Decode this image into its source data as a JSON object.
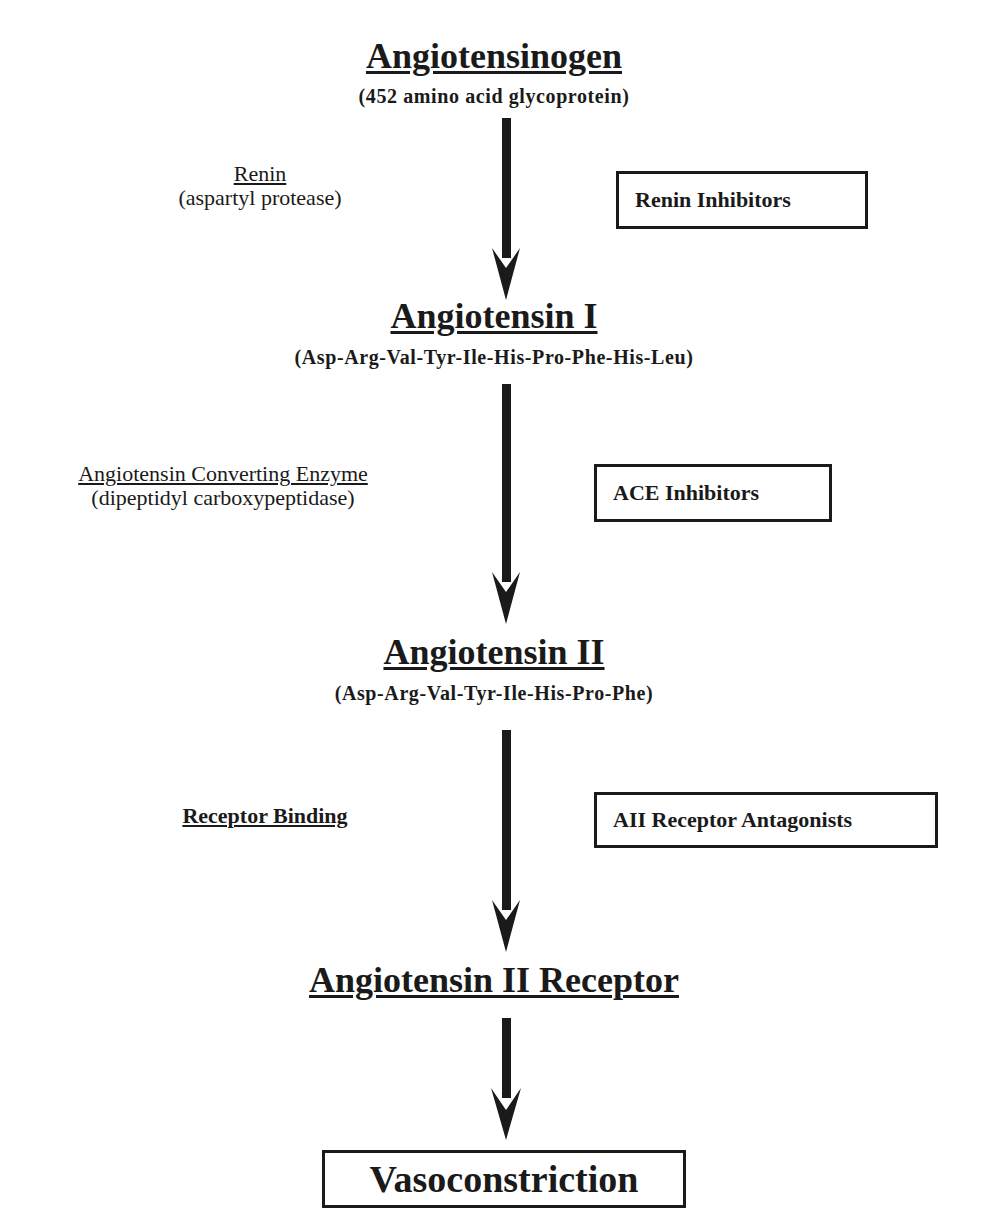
{
  "diagram": {
    "type": "pathway-flowchart",
    "nodes": [
      {
        "id": "angiotensinogen",
        "title": "Angiotensinogen",
        "subtitle": "(452 amino acid glycoprotein)"
      },
      {
        "id": "angiotensin-1",
        "title": "Angiotensin I",
        "subtitle": "(Asp-Arg-Val-Tyr-Ile-His-Pro-Phe-His-Leu)"
      },
      {
        "id": "angiotensin-2",
        "title": "Angiotensin II",
        "subtitle": "(Asp-Arg-Val-Tyr-Ile-His-Pro-Phe)"
      },
      {
        "id": "angiotensin-2-receptor",
        "title": "Angiotensin II Receptor"
      },
      {
        "id": "vasoconstriction",
        "title": "Vasoconstriction"
      }
    ],
    "steps": [
      {
        "from": "angiotensinogen",
        "to": "angiotensin-1",
        "enzyme": "Renin",
        "enzyme_detail": "(aspartyl protease)",
        "inhibitor": "Renin Inhibitors"
      },
      {
        "from": "angiotensin-1",
        "to": "angiotensin-2",
        "enzyme": "Angiotensin Converting Enzyme",
        "enzyme_detail": "(dipeptidyl carboxypeptidase)",
        "inhibitor": "ACE Inhibitors"
      },
      {
        "from": "angiotensin-2",
        "to": "angiotensin-2-receptor",
        "enzyme": "Receptor Binding",
        "enzyme_detail": "",
        "inhibitor": "AII Receptor Antagonists"
      },
      {
        "from": "angiotensin-2-receptor",
        "to": "vasoconstriction",
        "enzyme": "",
        "enzyme_detail": "",
        "inhibitor": ""
      }
    ]
  },
  "colors": {
    "ink": "#1a1a1a",
    "background": "#ffffff"
  }
}
